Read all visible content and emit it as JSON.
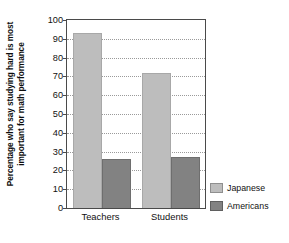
{
  "chart_data": {
    "type": "bar",
    "title": "",
    "subtitle": "",
    "xlabel": "",
    "ylabel_lines": [
      "Percentage who say studying hard is most",
      "important for math performance"
    ],
    "ylabel": "Percentage who say studying hard is most important for math performance",
    "categories": [
      "Teachers",
      "Students"
    ],
    "series": [
      {
        "name": "Japanese",
        "color": "#bdbdbd",
        "values": [
          93,
          72
        ]
      },
      {
        "name": "Americans",
        "color": "#828282",
        "values": [
          26,
          27
        ]
      }
    ],
    "ylim": [
      0,
      100
    ],
    "yticks": [
      0,
      10,
      20,
      30,
      40,
      50,
      60,
      70,
      80,
      90,
      100
    ],
    "ytick_labels": [
      "0",
      "10",
      "20",
      "30",
      "40",
      "50",
      "60",
      "70",
      "80",
      "90",
      "100"
    ],
    "grid": true,
    "grid_style": "dotted",
    "legend_position": "right-bottom",
    "legend_entries": [
      "Japanese",
      "Americans"
    ],
    "annotations": []
  },
  "legend": {
    "items": [
      {
        "label": "Japanese"
      },
      {
        "label": "Americans"
      }
    ]
  },
  "axes": {
    "x_tick_labels": [
      "Teachers",
      "Students"
    ],
    "y_tick_labels": [
      "100",
      "90",
      "80",
      "70",
      "60",
      "50",
      "40",
      "30",
      "20",
      "10",
      "0"
    ]
  }
}
